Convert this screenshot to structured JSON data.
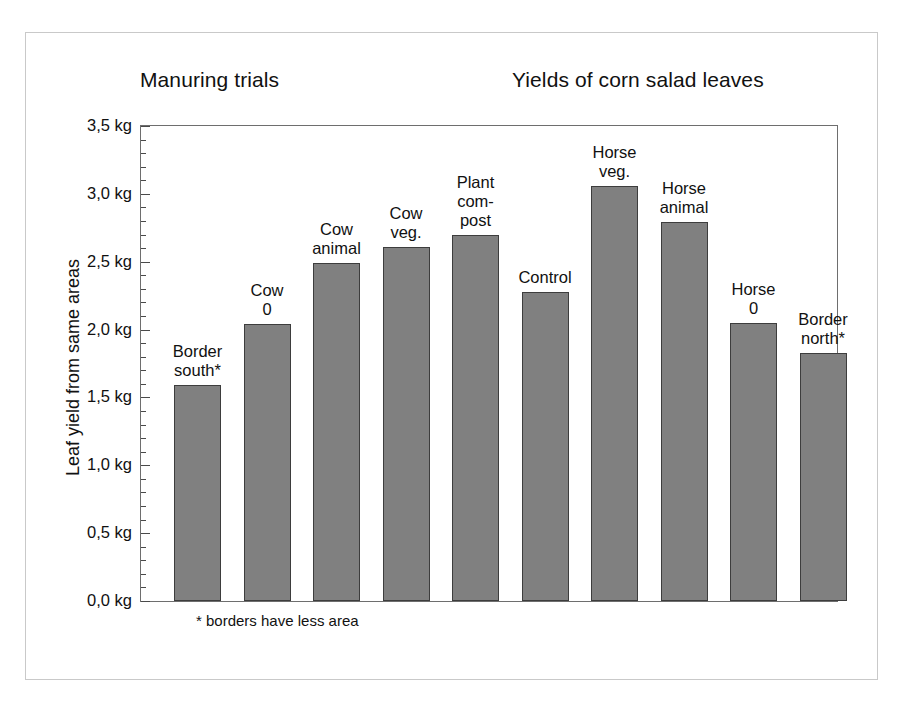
{
  "titles": {
    "left": "Manuring trials",
    "right": "Yields of corn salad leaves"
  },
  "footnote": "* borders have less area",
  "chart_data": {
    "type": "bar",
    "title": "Yields of corn salad leaves",
    "subtitle": "Manuring trials",
    "xlabel": "",
    "ylabel": "Leaf yield from same areas",
    "ylim": [
      0.0,
      3.5
    ],
    "ytick_labels": [
      "3,5 kg",
      "3,0 kg",
      "2,5 kg",
      "2,0 kg",
      "1,5 kg",
      "1,0 kg",
      "0,5 kg",
      "0,0 kg"
    ],
    "ytick_values": [
      3.5,
      3.0,
      2.5,
      2.0,
      1.5,
      1.0,
      0.5,
      0.0
    ],
    "minor_tick_step": 0.1,
    "grid": false,
    "legend": "none",
    "unit": "kg",
    "bar_color": "#808080",
    "bar_border_color": "#3d3d3d",
    "categories": [
      "Border south*",
      "Cow 0",
      "Cow animal",
      "Cow veg.",
      "Plant com-post",
      "Control",
      "Horse veg.",
      "Horse animal",
      "Horse 0",
      "Border north*"
    ],
    "category_label_lines": [
      "Border\nsouth*",
      "Cow\n0",
      "Cow\nanimal",
      "Cow\nveg.",
      "Plant\ncom-\npost",
      "Control",
      "Horse\nveg.",
      "Horse\nanimal",
      "Horse\n0",
      "Border\nnorth*"
    ],
    "values": [
      1.59,
      2.04,
      2.49,
      2.61,
      2.7,
      2.28,
      3.06,
      2.79,
      2.05,
      1.83
    ],
    "annotations": [
      "* borders have less area"
    ]
  }
}
